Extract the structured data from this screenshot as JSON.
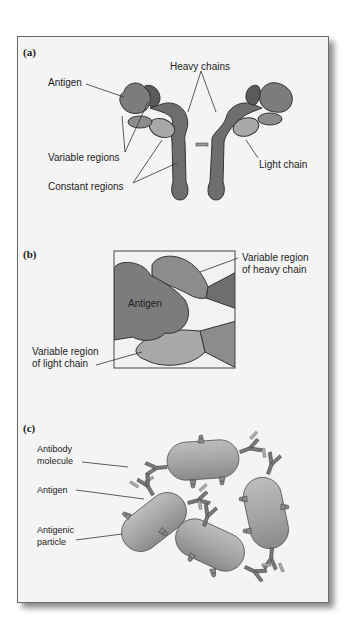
{
  "figure": {
    "panels": [
      {
        "id": "a",
        "label": "(a)",
        "annotations": {
          "heavy_chains": "Heavy chains",
          "antigen": "Antigen",
          "variable_regions": "Variable regions",
          "light_chain": "Light chain",
          "constant_regions": "Constant regions"
        }
      },
      {
        "id": "b",
        "label": "(b)",
        "annotations": {
          "antigen": "Antigen",
          "variable_heavy_line1": "Variable region",
          "variable_heavy_line2": "of heavy chain",
          "variable_light_line1": "Variable region",
          "variable_light_line2": "of light chain"
        }
      },
      {
        "id": "c",
        "label": "(c)",
        "annotations": {
          "antibody_line1": "Antibody",
          "antibody_line2": "molecule",
          "antigen": "Antigen",
          "particle_line1": "Antigenic",
          "particle_line2": "particle"
        }
      }
    ],
    "colors": {
      "frame_bg": "#f4f4f4",
      "heavy_chain": "#6e6e6e",
      "heavy_variable": "#5a5a5a",
      "antigen": "#7c7c7c",
      "light_chain": "#a8a8a8",
      "light_variable": "#8c8c8c",
      "particle": "#a6a6a6"
    }
  }
}
